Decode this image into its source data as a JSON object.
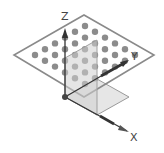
{
  "diagram": {
    "title": "",
    "axes": {
      "x": {
        "label": "X"
      },
      "y": {
        "label": "Y"
      },
      "z": {
        "label": "Z"
      }
    },
    "dot_grid": {
      "rows": 6,
      "cols": 6
    },
    "colors": {
      "plane_outline": "#8a8a8a",
      "dots": "#8c8c8c",
      "axis": "#333333",
      "shaded_plane": "#d9d9d9",
      "background": "#ffffff"
    }
  }
}
